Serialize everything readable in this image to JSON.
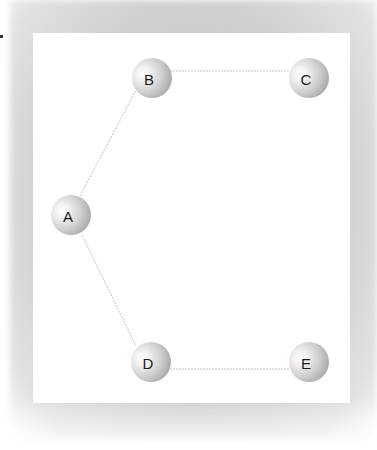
{
  "diagram": {
    "type": "graph",
    "nodes": [
      {
        "id": "A",
        "label": "A",
        "x": 71,
        "y": 215
      },
      {
        "id": "B",
        "label": "B",
        "x": 152,
        "y": 78
      },
      {
        "id": "C",
        "label": "C",
        "x": 309,
        "y": 78
      },
      {
        "id": "D",
        "label": "D",
        "x": 151,
        "y": 362
      },
      {
        "id": "E",
        "label": "E",
        "x": 309,
        "y": 362
      }
    ],
    "edges": [
      {
        "from": "A",
        "to": "B"
      },
      {
        "from": "B",
        "to": "C"
      },
      {
        "from": "A",
        "to": "D"
      },
      {
        "from": "D",
        "to": "E"
      }
    ],
    "colors": {
      "edge": "#c4c4c4",
      "panel": "#ffffff",
      "frame": "#cccccc",
      "node_label": "#1a1a1a"
    }
  }
}
